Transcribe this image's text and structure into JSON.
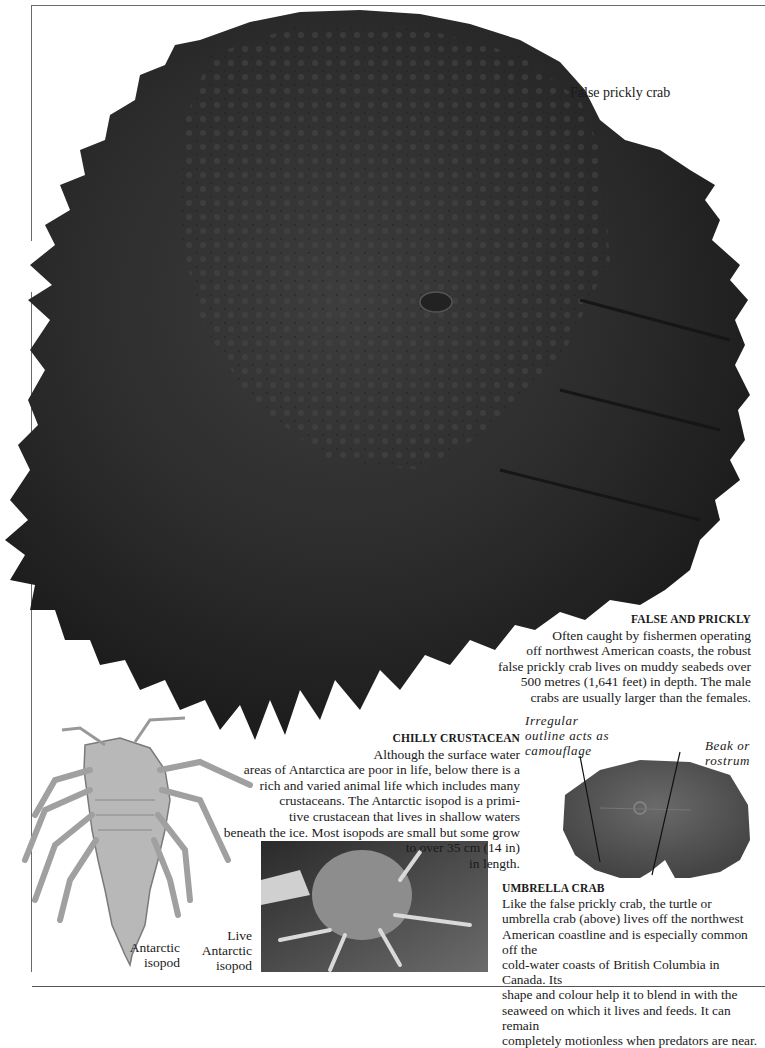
{
  "page": {
    "background": "#ffffff",
    "rule_color": "#6a6a6a"
  },
  "images": {
    "main_crab": {
      "label": "False prickly crab",
      "color": "#2e2e2e"
    },
    "umbrella_crab": {
      "color": "#555555"
    },
    "antarctic_isopod": {
      "color": "#bdbdbd"
    },
    "live_isopod_photo": {
      "color": "#4a4a4a"
    }
  },
  "labels": {
    "false_prickly_crab": "False prickly crab",
    "irregular": [
      "Irregular",
      "outline acts as",
      "camouflage"
    ],
    "beak": [
      "Beak  or",
      "rostrum"
    ],
    "antarctic_isopod": [
      "Antarctic",
      "isopod"
    ],
    "live_antarctic_isopod": [
      "Live",
      "Antarctic",
      "isopod"
    ]
  },
  "captions": {
    "false_and_prickly": {
      "heading": "FALSE AND PRICKLY",
      "lines": [
        "Often caught by fishermen operating",
        "off northwest American coasts, the robust",
        "false prickly crab lives on muddy seabeds over",
        "500 metres (1,641 feet) in depth. The male",
        "crabs are usually larger than the females."
      ]
    },
    "chilly_crustacean": {
      "heading": "CHILLY CRUSTACEAN",
      "lines": [
        "Although the surface water",
        "areas of Antarctica are poor in life,  below there is a",
        "rich and varied animal life which includes many",
        "crustaceans. The Antarctic isopod is a primi-",
        "tive crustacean that lives in shallow waters",
        "beneath the ice. Most isopods are small but some grow",
        "to over 35 cm  (14 in)",
        "in length."
      ]
    },
    "umbrella_crab": {
      "heading": "UMBRELLA CRAB",
      "lines": [
        "Like the false prickly crab, the turtle or",
        "umbrella crab (above) lives off the northwest",
        "American coastline and is especially common off the",
        "cold-water coasts of British Columbia in Canada.  Its",
        "shape and colour help it to blend in with the",
        "seaweed on which it lives and feeds.  It  can remain",
        "completely motionless when predators are near."
      ]
    }
  }
}
